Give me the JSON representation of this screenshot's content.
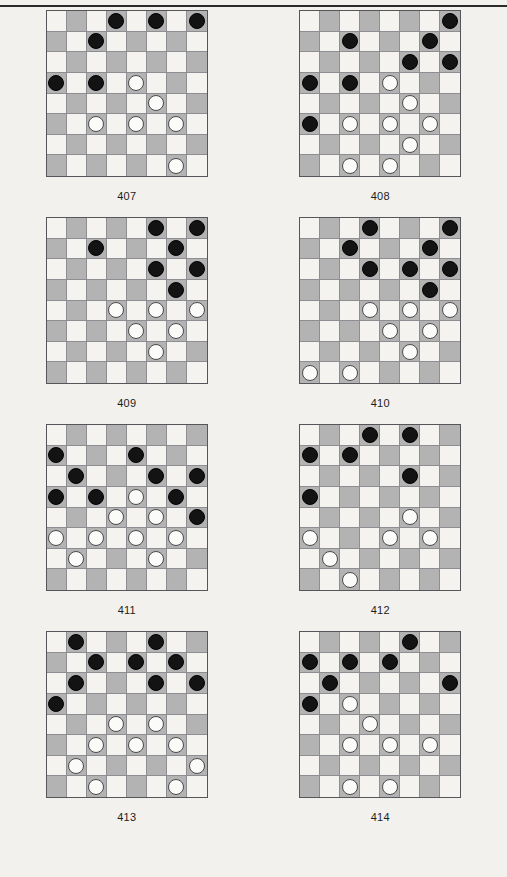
{
  "page": {
    "background_color": "#f2f1ed",
    "rule_color": "#2b2b2b",
    "board_light_color": "#f4f3ef",
    "board_dark_color": "#b3b3b3",
    "piece_black_color": "#131313",
    "piece_white_color": "#fbfbf9"
  },
  "puzzles": [
    {
      "caption": "407",
      "board": {
        "rows": 8,
        "cols": 8,
        "black": [
          [
            0,
            3
          ],
          [
            0,
            5
          ],
          [
            0,
            7
          ],
          [
            1,
            2
          ],
          [
            3,
            0
          ],
          [
            3,
            2
          ],
          [
            5,
            2
          ],
          [
            5,
            4
          ],
          [
            5,
            6
          ]
        ],
        "white": [
          [
            3,
            4
          ],
          [
            4,
            5
          ],
          [
            5,
            2
          ],
          [
            5,
            4
          ],
          [
            5,
            6
          ],
          [
            7,
            6
          ]
        ],
        "pieces": [
          {
            "row": 0,
            "col": 3,
            "color": "black"
          },
          {
            "row": 0,
            "col": 5,
            "color": "black"
          },
          {
            "row": 0,
            "col": 7,
            "color": "black"
          },
          {
            "row": 1,
            "col": 2,
            "color": "black"
          },
          {
            "row": 3,
            "col": 0,
            "color": "black"
          },
          {
            "row": 3,
            "col": 2,
            "color": "black"
          },
          {
            "row": 3,
            "col": 4,
            "color": "white"
          },
          {
            "row": 4,
            "col": 5,
            "color": "white"
          },
          {
            "row": 5,
            "col": 2,
            "color": "white"
          },
          {
            "row": 5,
            "col": 4,
            "color": "white"
          },
          {
            "row": 5,
            "col": 6,
            "color": "white"
          },
          {
            "row": 7,
            "col": 6,
            "color": "white"
          }
        ]
      }
    },
    {
      "caption": "408",
      "board": {
        "rows": 8,
        "cols": 8,
        "pieces": [
          {
            "row": 0,
            "col": 7,
            "color": "black"
          },
          {
            "row": 1,
            "col": 2,
            "color": "black"
          },
          {
            "row": 1,
            "col": 6,
            "color": "black"
          },
          {
            "row": 2,
            "col": 5,
            "color": "black"
          },
          {
            "row": 2,
            "col": 7,
            "color": "black"
          },
          {
            "row": 3,
            "col": 0,
            "color": "black"
          },
          {
            "row": 3,
            "col": 2,
            "color": "black"
          },
          {
            "row": 3,
            "col": 4,
            "color": "white"
          },
          {
            "row": 4,
            "col": 5,
            "color": "white"
          },
          {
            "row": 5,
            "col": 0,
            "color": "black"
          },
          {
            "row": 5,
            "col": 2,
            "color": "white"
          },
          {
            "row": 5,
            "col": 4,
            "color": "white"
          },
          {
            "row": 5,
            "col": 6,
            "color": "white"
          },
          {
            "row": 6,
            "col": 5,
            "color": "white"
          },
          {
            "row": 7,
            "col": 2,
            "color": "white"
          },
          {
            "row": 7,
            "col": 4,
            "color": "white"
          }
        ]
      }
    },
    {
      "caption": "409",
      "board": {
        "rows": 8,
        "cols": 8,
        "pieces": [
          {
            "row": 0,
            "col": 5,
            "color": "black"
          },
          {
            "row": 0,
            "col": 7,
            "color": "black"
          },
          {
            "row": 1,
            "col": 2,
            "color": "black"
          },
          {
            "row": 1,
            "col": 6,
            "color": "black"
          },
          {
            "row": 2,
            "col": 5,
            "color": "black"
          },
          {
            "row": 2,
            "col": 7,
            "color": "black"
          },
          {
            "row": 3,
            "col": 6,
            "color": "black"
          },
          {
            "row": 4,
            "col": 3,
            "color": "white"
          },
          {
            "row": 4,
            "col": 5,
            "color": "white"
          },
          {
            "row": 4,
            "col": 7,
            "color": "white"
          },
          {
            "row": 5,
            "col": 4,
            "color": "white"
          },
          {
            "row": 5,
            "col": 6,
            "color": "white"
          },
          {
            "row": 6,
            "col": 5,
            "color": "white"
          }
        ]
      }
    },
    {
      "caption": "410",
      "board": {
        "rows": 8,
        "cols": 8,
        "pieces": [
          {
            "row": 0,
            "col": 3,
            "color": "black"
          },
          {
            "row": 0,
            "col": 7,
            "color": "black"
          },
          {
            "row": 1,
            "col": 2,
            "color": "black"
          },
          {
            "row": 1,
            "col": 6,
            "color": "black"
          },
          {
            "row": 2,
            "col": 3,
            "color": "black"
          },
          {
            "row": 2,
            "col": 5,
            "color": "black"
          },
          {
            "row": 2,
            "col": 7,
            "color": "black"
          },
          {
            "row": 3,
            "col": 6,
            "color": "black"
          },
          {
            "row": 4,
            "col": 3,
            "color": "white"
          },
          {
            "row": 4,
            "col": 5,
            "color": "white"
          },
          {
            "row": 4,
            "col": 7,
            "color": "white"
          },
          {
            "row": 5,
            "col": 4,
            "color": "white"
          },
          {
            "row": 5,
            "col": 6,
            "color": "white"
          },
          {
            "row": 6,
            "col": 5,
            "color": "white"
          },
          {
            "row": 7,
            "col": 0,
            "color": "white"
          },
          {
            "row": 7,
            "col": 2,
            "color": "white"
          }
        ]
      }
    },
    {
      "caption": "411",
      "board": {
        "rows": 8,
        "cols": 8,
        "pieces": [
          {
            "row": 1,
            "col": 0,
            "color": "black"
          },
          {
            "row": 1,
            "col": 4,
            "color": "black"
          },
          {
            "row": 2,
            "col": 1,
            "color": "black"
          },
          {
            "row": 2,
            "col": 5,
            "color": "black"
          },
          {
            "row": 2,
            "col": 7,
            "color": "black"
          },
          {
            "row": 3,
            "col": 0,
            "color": "black"
          },
          {
            "row": 3,
            "col": 2,
            "color": "black"
          },
          {
            "row": 3,
            "col": 4,
            "color": "white"
          },
          {
            "row": 3,
            "col": 6,
            "color": "black"
          },
          {
            "row": 4,
            "col": 3,
            "color": "white"
          },
          {
            "row": 4,
            "col": 5,
            "color": "white"
          },
          {
            "row": 4,
            "col": 7,
            "color": "black"
          },
          {
            "row": 5,
            "col": 0,
            "color": "white"
          },
          {
            "row": 5,
            "col": 2,
            "color": "white"
          },
          {
            "row": 5,
            "col": 4,
            "color": "white"
          },
          {
            "row": 5,
            "col": 6,
            "color": "white"
          },
          {
            "row": 6,
            "col": 1,
            "color": "white"
          },
          {
            "row": 6,
            "col": 5,
            "color": "white"
          }
        ]
      }
    },
    {
      "caption": "412",
      "board": {
        "rows": 8,
        "cols": 8,
        "pieces": [
          {
            "row": 0,
            "col": 3,
            "color": "black"
          },
          {
            "row": 0,
            "col": 5,
            "color": "black"
          },
          {
            "row": 1,
            "col": 0,
            "color": "black"
          },
          {
            "row": 1,
            "col": 2,
            "color": "black"
          },
          {
            "row": 2,
            "col": 5,
            "color": "black"
          },
          {
            "row": 3,
            "col": 0,
            "color": "black"
          },
          {
            "row": 4,
            "col": 5,
            "color": "white"
          },
          {
            "row": 5,
            "col": 0,
            "color": "white"
          },
          {
            "row": 5,
            "col": 4,
            "color": "white"
          },
          {
            "row": 5,
            "col": 6,
            "color": "white"
          },
          {
            "row": 6,
            "col": 1,
            "color": "white"
          },
          {
            "row": 7,
            "col": 2,
            "color": "white"
          }
        ]
      }
    },
    {
      "caption": "413",
      "board": {
        "rows": 8,
        "cols": 8,
        "pieces": [
          {
            "row": 0,
            "col": 1,
            "color": "black"
          },
          {
            "row": 0,
            "col": 5,
            "color": "black"
          },
          {
            "row": 1,
            "col": 2,
            "color": "black"
          },
          {
            "row": 1,
            "col": 4,
            "color": "black"
          },
          {
            "row": 1,
            "col": 6,
            "color": "black"
          },
          {
            "row": 2,
            "col": 1,
            "color": "black"
          },
          {
            "row": 2,
            "col": 5,
            "color": "black"
          },
          {
            "row": 2,
            "col": 7,
            "color": "black"
          },
          {
            "row": 3,
            "col": 0,
            "color": "black"
          },
          {
            "row": 4,
            "col": 3,
            "color": "white"
          },
          {
            "row": 4,
            "col": 5,
            "color": "white"
          },
          {
            "row": 5,
            "col": 2,
            "color": "white"
          },
          {
            "row": 5,
            "col": 4,
            "color": "white"
          },
          {
            "row": 5,
            "col": 6,
            "color": "white"
          },
          {
            "row": 6,
            "col": 1,
            "color": "white"
          },
          {
            "row": 6,
            "col": 7,
            "color": "white"
          },
          {
            "row": 7,
            "col": 2,
            "color": "white"
          },
          {
            "row": 7,
            "col": 6,
            "color": "white"
          }
        ]
      }
    },
    {
      "caption": "414",
      "board": {
        "rows": 8,
        "cols": 8,
        "pieces": [
          {
            "row": 0,
            "col": 5,
            "color": "black"
          },
          {
            "row": 1,
            "col": 0,
            "color": "black"
          },
          {
            "row": 1,
            "col": 2,
            "color": "black"
          },
          {
            "row": 1,
            "col": 4,
            "color": "black"
          },
          {
            "row": 2,
            "col": 1,
            "color": "black"
          },
          {
            "row": 2,
            "col": 7,
            "color": "black"
          },
          {
            "row": 3,
            "col": 0,
            "color": "black"
          },
          {
            "row": 3,
            "col": 2,
            "color": "white"
          },
          {
            "row": 4,
            "col": 3,
            "color": "white"
          },
          {
            "row": 5,
            "col": 2,
            "color": "white"
          },
          {
            "row": 5,
            "col": 4,
            "color": "white"
          },
          {
            "row": 5,
            "col": 6,
            "color": "white"
          },
          {
            "row": 7,
            "col": 2,
            "color": "white"
          },
          {
            "row": 7,
            "col": 4,
            "color": "white"
          }
        ]
      }
    }
  ]
}
